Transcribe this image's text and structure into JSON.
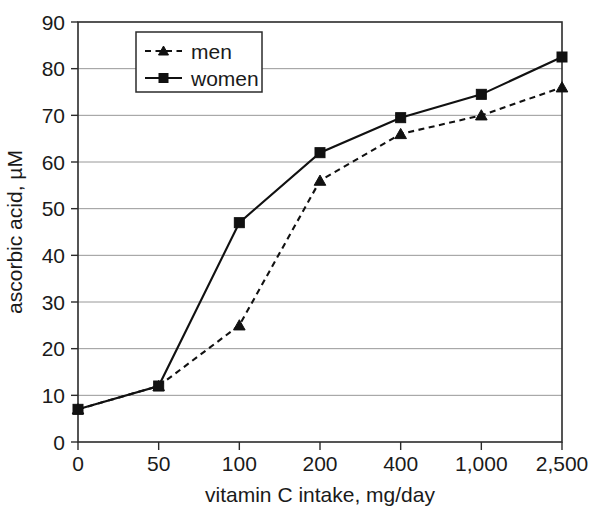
{
  "chart_data": {
    "type": "line",
    "title": "",
    "xlabel": "vitamin C intake, mg/day",
    "ylabel": "ascorbic acid, µM",
    "categories": [
      "0",
      "50",
      "100",
      "200",
      "400",
      "1,000",
      "2,500"
    ],
    "x_tick_labels": [
      "0",
      "50",
      "100",
      "200",
      "400",
      "1,000",
      "2,500"
    ],
    "y_tick_labels": [
      "0",
      "10",
      "20",
      "30",
      "40",
      "50",
      "60",
      "70",
      "80",
      "90"
    ],
    "y_ticks": [
      0,
      10,
      20,
      30,
      40,
      50,
      60,
      70,
      80,
      90
    ],
    "ylim": [
      0,
      90
    ],
    "grid": "horizontal",
    "legend_position": "top-left-inside",
    "series": [
      {
        "name": "men",
        "label": "men",
        "marker": "triangle",
        "line_style": "dashed",
        "color": "#111111",
        "values": [
          7,
          12,
          25,
          56,
          66,
          70,
          76
        ]
      },
      {
        "name": "women",
        "label": "women",
        "marker": "square",
        "line_style": "solid",
        "color": "#111111",
        "values": [
          7,
          12,
          47,
          62,
          69.5,
          74.5,
          82.5
        ]
      }
    ]
  },
  "legend": {
    "entries": [
      {
        "label": "men"
      },
      {
        "label": "women"
      }
    ]
  },
  "colors": {
    "ink": "#111111",
    "axis": "#2b2b2b",
    "grid": "#8c8c8c",
    "background": "#ffffff"
  }
}
